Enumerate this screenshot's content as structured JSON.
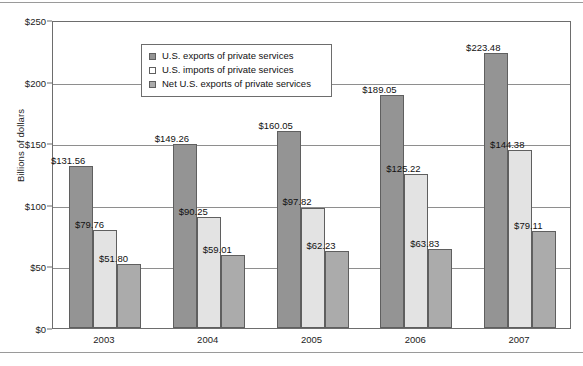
{
  "chart_data": {
    "type": "bar",
    "title": "",
    "xlabel": "",
    "ylabel": "Billions of dollars",
    "ylim": [
      0,
      250
    ],
    "ytick_step": 50,
    "ytick_labels": [
      "$0",
      "$50",
      "$100",
      "$150",
      "$200",
      "$250"
    ],
    "ytick_values": [
      0,
      50,
      100,
      150,
      200,
      250
    ],
    "gridlines": [
      50,
      100,
      150,
      200
    ],
    "grid": true,
    "legend_position": "top-left-inside",
    "categories": [
      "2003",
      "2004",
      "2005",
      "2006",
      "2007"
    ],
    "series": [
      {
        "name": "U.S. exports of private services",
        "color": "#949494",
        "values": [
          131.56,
          149.26,
          160.05,
          189.05,
          223.48
        ],
        "labels": [
          "$131.56",
          "$149.26",
          "$160.05",
          "$189.05",
          "$223.48"
        ]
      },
      {
        "name": "U.S. imports of private services",
        "color": "#e3e3e3",
        "legend_color": "#ffffff",
        "values": [
          79.76,
          90.25,
          97.82,
          125.22,
          144.38
        ],
        "labels": [
          "$79.76",
          "$90.25",
          "$97.82",
          "$125.22",
          "$144.38"
        ]
      },
      {
        "name": "Net U.S. exports of private services",
        "color": "#ababab",
        "values": [
          51.8,
          59.01,
          62.23,
          63.83,
          79.11
        ],
        "labels": [
          "$51.80",
          "$59.01",
          "$62.23",
          "$63.83",
          "$79.11"
        ]
      }
    ]
  },
  "legend": {
    "items": [
      {
        "label": "U.S. exports of private services"
      },
      {
        "label": "U.S. imports of private services"
      },
      {
        "label": "Net U.S. exports of private services"
      }
    ]
  },
  "axes": {
    "y_title": "Billions of dollars"
  }
}
